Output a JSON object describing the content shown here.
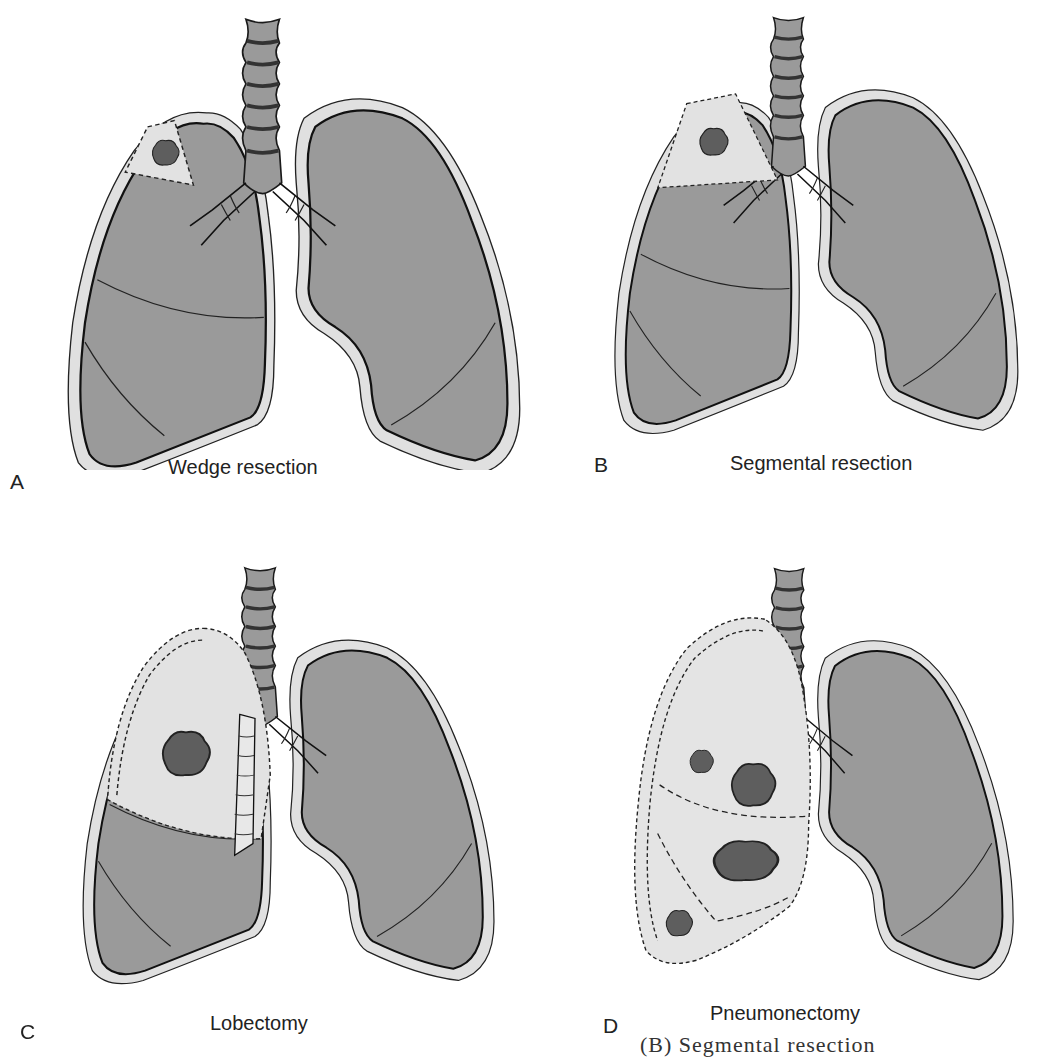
{
  "figure": {
    "panels": [
      {
        "letter": "A",
        "caption": "Wedge resection",
        "resected_region": "wedge",
        "tumors": 1
      },
      {
        "letter": "B",
        "caption": "Segmental resection",
        "resected_region": "segment",
        "tumors": 1
      },
      {
        "letter": "C",
        "caption": "Lobectomy",
        "resected_region": "upper-lobe",
        "tumors": 1
      },
      {
        "letter": "D",
        "caption": "Pneumonectomy",
        "resected_region": "entire-lung",
        "tumors": 4
      }
    ],
    "cutoff_text": "(B) Segmental resection",
    "colors": {
      "lung_fill": "#9a9a9a",
      "pleura_fill": "#e0e0e0",
      "resected_fill": "#e4e4e4",
      "tumor_fill": "#5a5a5a",
      "outline": "#1a1a1a"
    }
  }
}
